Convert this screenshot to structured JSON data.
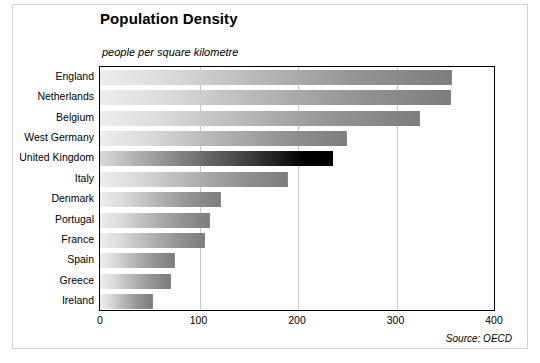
{
  "chart_data": {
    "type": "bar",
    "orientation": "horizontal",
    "title": "Population Density",
    "subtitle": "people per square kilometre",
    "xlabel": "",
    "ylabel": "",
    "xlim": [
      0,
      400
    ],
    "ylim": null,
    "xticks": [
      0,
      100,
      200,
      300,
      400
    ],
    "xtick_labels": [
      "0",
      "100",
      "200",
      "300",
      "400"
    ],
    "grid": true,
    "grid_axis": "x",
    "legend": null,
    "source_note": "Source: OECD",
    "categories": [
      "England",
      "Netherlands",
      "Belgium",
      "West Germany",
      "United Kingdom",
      "Italy",
      "Denmark",
      "Portugal",
      "France",
      "Spain",
      "Greece",
      "Ireland"
    ],
    "values": [
      357,
      356,
      325,
      251,
      237,
      191,
      123,
      112,
      107,
      76,
      72,
      54
    ],
    "highlight_category": "United Kingdom",
    "bars": [
      {
        "label": "England",
        "value": 357,
        "style": "normal"
      },
      {
        "label": "Netherlands",
        "value": 356,
        "style": "normal"
      },
      {
        "label": "Belgium",
        "value": 325,
        "style": "normal"
      },
      {
        "label": "West Germany",
        "value": 251,
        "style": "normal"
      },
      {
        "label": "United Kingdom",
        "value": 237,
        "style": "highlight"
      },
      {
        "label": "Italy",
        "value": 191,
        "style": "normal"
      },
      {
        "label": "Denmark",
        "value": 123,
        "style": "normal"
      },
      {
        "label": "Portugal",
        "value": 112,
        "style": "normal"
      },
      {
        "label": "France",
        "value": 107,
        "style": "normal"
      },
      {
        "label": "Spain",
        "value": 76,
        "style": "normal"
      },
      {
        "label": "Greece",
        "value": 72,
        "style": "normal"
      },
      {
        "label": "Ireland",
        "value": 54,
        "style": "normal"
      }
    ],
    "colors": {
      "bar_gradient_start": "#ededed",
      "bar_gradient_end": "#7d7d7d",
      "highlight_gradient_start": "#d9d9d9",
      "highlight_gradient_end": "#000000",
      "axis": "#000000",
      "gridline": "#c8c8c8",
      "background": "#ffffff",
      "frame": "#d3d3d3"
    }
  }
}
